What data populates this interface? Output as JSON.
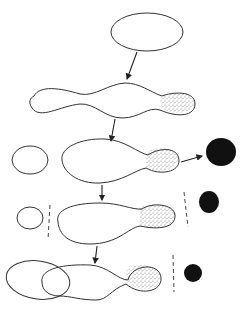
{
  "diagram": {
    "title": "",
    "stages": [
      {
        "id": 1,
        "label": ""
      },
      {
        "id": 2,
        "label": ""
      },
      {
        "id": 3,
        "label": ""
      },
      {
        "id": 4,
        "label": ""
      },
      {
        "id": 5,
        "label": ""
      }
    ],
    "colors": {
      "outline": "#333333",
      "dark_body": "#111111",
      "stipple": "#9a9a9a",
      "background": "#ffffff"
    }
  }
}
